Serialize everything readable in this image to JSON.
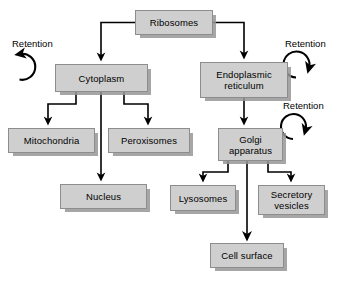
{
  "diagram": {
    "type": "flow-diagram",
    "style": {
      "node_fill": "#cfcfcf",
      "node_border": "#8d8d8d",
      "node_shadow": "#969696",
      "arrow_color": "#000000",
      "background": "#ffffff"
    },
    "nodes": [
      {
        "id": "ribosomes",
        "label": "Ribosomes",
        "x": 135,
        "y": 10,
        "w": 78,
        "h": 25
      },
      {
        "id": "cytoplasm",
        "label": "Cytoplasm",
        "x": 55,
        "y": 64,
        "w": 93,
        "h": 28
      },
      {
        "id": "er",
        "label": "Endoplasmic\nreticulum",
        "x": 200,
        "y": 62,
        "w": 88,
        "h": 36
      },
      {
        "id": "mitochondria",
        "label": "Mitochondria",
        "x": 8,
        "y": 128,
        "w": 87,
        "h": 25
      },
      {
        "id": "peroxisomes",
        "label": "Peroxisomes",
        "x": 108,
        "y": 128,
        "w": 82,
        "h": 25
      },
      {
        "id": "golgi",
        "label": "Golgi\napparatus",
        "x": 218,
        "y": 128,
        "w": 65,
        "h": 33
      },
      {
        "id": "nucleus",
        "label": "Nucleus",
        "x": 60,
        "y": 184,
        "w": 87,
        "h": 25
      },
      {
        "id": "lysosomes",
        "label": "Lysosomes",
        "x": 170,
        "y": 185,
        "w": 66,
        "h": 26
      },
      {
        "id": "secretory",
        "label": "Secretory\nvesicles",
        "x": 258,
        "y": 185,
        "w": 67,
        "h": 30
      },
      {
        "id": "cellsurface",
        "label": "Cell surface",
        "x": 210,
        "y": 243,
        "w": 74,
        "h": 25
      }
    ],
    "retention_labels": [
      {
        "id": "retention-cytoplasm",
        "label": "Retention",
        "x": 12,
        "y": 38
      },
      {
        "id": "retention-er",
        "label": "Retention",
        "x": 285,
        "y": 38
      },
      {
        "id": "retention-golgi",
        "label": "Retention",
        "x": 283,
        "y": 100
      }
    ],
    "edges": [
      {
        "from": "ribosomes",
        "to": "cytoplasm",
        "kind": "elbow-down-left"
      },
      {
        "from": "ribosomes",
        "to": "er",
        "kind": "elbow-down-right"
      },
      {
        "from": "cytoplasm",
        "to": "mitochondria",
        "kind": "elbow-down-left"
      },
      {
        "from": "cytoplasm",
        "to": "peroxisomes",
        "kind": "elbow-down-right"
      },
      {
        "from": "cytoplasm",
        "to": "nucleus",
        "kind": "straight-down"
      },
      {
        "from": "er",
        "to": "golgi",
        "kind": "straight-down"
      },
      {
        "from": "golgi",
        "to": "lysosomes",
        "kind": "elbow-down-left"
      },
      {
        "from": "golgi",
        "to": "secretory",
        "kind": "elbow-down-right"
      },
      {
        "from": "golgi",
        "to": "cellsurface",
        "kind": "straight-down"
      },
      {
        "from": "cytoplasm",
        "to": "cytoplasm",
        "kind": "retention-loop-left"
      },
      {
        "from": "er",
        "to": "er",
        "kind": "retention-loop-right"
      },
      {
        "from": "golgi",
        "to": "golgi",
        "kind": "retention-loop-right"
      }
    ]
  }
}
